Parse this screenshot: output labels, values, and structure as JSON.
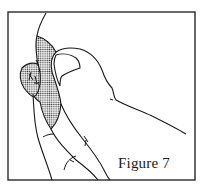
{
  "figure": {
    "caption": "Figure 7",
    "illustration": "thumb-pressing-areola-line-drawing",
    "colors": {
      "ink": "#1a1a1a",
      "background": "#ffffff",
      "shading": "#9a9a9a"
    }
  }
}
